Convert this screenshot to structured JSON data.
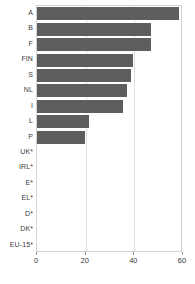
{
  "chart_data": {
    "type": "bar",
    "orientation": "horizontal",
    "title": "",
    "subtitle": "",
    "xlabel": "",
    "ylabel": "",
    "xlim": [
      0,
      60
    ],
    "xticks": [
      0,
      20,
      40,
      60
    ],
    "xtick_labels": [
      "0",
      "20",
      "40",
      "60"
    ],
    "grid": "vertical",
    "gridlines_at": [
      20,
      40
    ],
    "legend": "none",
    "bar_color": "#5e5e5e",
    "plot_border_color": "#d2d2d2",
    "gridline_color": "#dedede",
    "axis_text_color": "#3a3a3a",
    "categories": [
      "A",
      "B",
      "F",
      "FIN",
      "S",
      "NL",
      "I",
      "L",
      "P",
      "UK*",
      "IRL*",
      "E*",
      "EL*",
      "D*",
      "DK*",
      "EU-15*"
    ],
    "values": [
      58.5,
      47.0,
      46.8,
      39.5,
      38.7,
      37.0,
      35.4,
      21.4,
      19.7,
      0,
      0,
      0,
      0,
      0,
      0,
      0
    ]
  }
}
